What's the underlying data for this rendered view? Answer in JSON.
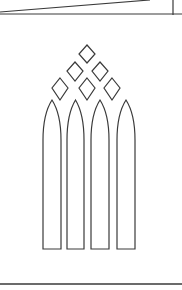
{
  "drawing": {
    "subject": "Gothic lancet window tracery line drawing",
    "stroke_color": "#3a3a3a",
    "background": "#ffffff",
    "top_band": {
      "horizontal_line": {
        "y": 14
      },
      "diagonal_line": {
        "x1": 0,
        "y1": 12,
        "x2": 150,
        "y2": 0
      },
      "vertical_line": {
        "x": 173,
        "y1": 0,
        "y2": 15
      }
    },
    "diamonds": [
      {
        "row": 1,
        "cx": 87,
        "cy": 54,
        "hw": 8,
        "top": 9,
        "bottom": 9
      },
      {
        "row": 2,
        "cx": 75,
        "cy": 71,
        "hw": 8,
        "top": 9,
        "bottom": 10
      },
      {
        "row": 2,
        "cx": 100,
        "cy": 71,
        "hw": 8,
        "top": 9,
        "bottom": 10
      },
      {
        "row": 3,
        "cx": 60,
        "cy": 88,
        "hw": 8,
        "top": 10,
        "bottom": 12
      },
      {
        "row": 3,
        "cx": 87,
        "cy": 88,
        "hw": 8,
        "top": 10,
        "bottom": 12
      },
      {
        "row": 3,
        "cx": 112,
        "cy": 88,
        "hw": 8,
        "top": 10,
        "bottom": 12
      }
    ],
    "lancets": [
      {
        "left": 43,
        "right": 61,
        "tip_y": 100,
        "spring_y": 140,
        "bottom": 249
      },
      {
        "left": 67,
        "right": 84,
        "tip_y": 100,
        "spring_y": 140,
        "bottom": 249
      },
      {
        "left": 91,
        "right": 109,
        "tip_y": 100,
        "spring_y": 140,
        "bottom": 249
      },
      {
        "left": 117,
        "right": 135,
        "tip_y": 100,
        "spring_y": 140,
        "bottom": 249
      }
    ],
    "bottom_line": {
      "y": 284,
      "x1": 0,
      "x2": 182
    }
  }
}
